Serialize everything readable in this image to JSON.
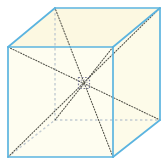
{
  "figure": {
    "name": "cube-space-diagonals-diagram",
    "shape": "cube",
    "projection": "oblique",
    "caption": "",
    "colors": {
      "edge_visible": "#5bb4e0",
      "edge_hidden": "#bcc7cf",
      "face_fill": "#fdfbe8",
      "face_fill_top": "#fcf8e0",
      "diagonal": "#4a4a42",
      "center_marker": "#6a6a8a",
      "background": "#ffffff"
    },
    "geometry": {
      "front_top_left": [
        8,
        47
      ],
      "front_top_right": [
        113,
        47
      ],
      "front_bottom_right": [
        113,
        157
      ],
      "front_bottom_left": [
        8,
        157
      ],
      "back_top_left": [
        55,
        8
      ],
      "back_top_right": [
        160,
        8
      ],
      "back_bottom_right": [
        160,
        120
      ],
      "back_bottom_left": [
        55,
        120
      ],
      "center": [
        84,
        83
      ]
    },
    "elements": {
      "front_face_label": "front face",
      "top_face_label": "top face",
      "right_face_label": "right face",
      "hidden_vertex_label": "hidden back-bottom-left vertex",
      "center_point_label": "center of cube",
      "diagonal_count": "4",
      "vertex_count": "8",
      "edge_count": "12"
    }
  }
}
